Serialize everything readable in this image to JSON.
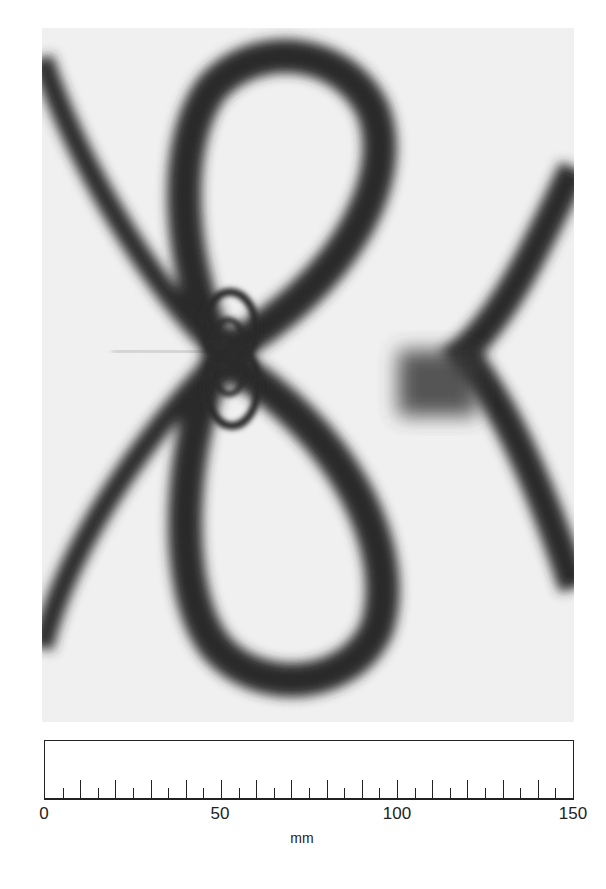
{
  "figure": {
    "colors": {
      "background": "#f2f2f2",
      "fringe": "#2a2a2a"
    }
  },
  "scale_bar": {
    "unit": "mm",
    "min": 0,
    "max": 150,
    "minor_tick_step": 5,
    "major_tick_step": 10,
    "labels": [
      {
        "value": 0,
        "text": "0"
      },
      {
        "value": 50,
        "text": "50"
      },
      {
        "value": 100,
        "text": "100"
      },
      {
        "value": 150,
        "text": "150"
      }
    ]
  }
}
